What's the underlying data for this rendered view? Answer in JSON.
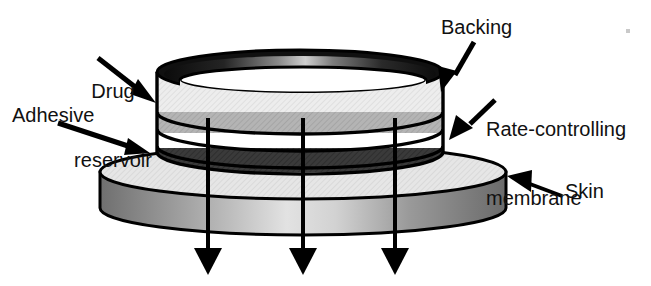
{
  "figure": {
    "type": "labeled-diagram",
    "background_color": "#ffffff"
  },
  "labels": {
    "drug_reservoir": {
      "line1": "Drug",
      "line2": "reservoir"
    },
    "adhesive": "Adhesive",
    "backing": "Backing",
    "rate_membrane": {
      "line1": "Rate-controlling",
      "line2": "membrane"
    },
    "skin": "Skin"
  },
  "layers": [
    {
      "name": "backing",
      "color": "#e8e8e8",
      "order": 1
    },
    {
      "name": "drug-reservoir",
      "color": "#b3b3b3",
      "order": 2
    },
    {
      "name": "rate-controlling-membrane",
      "color": "#ffffff",
      "order": 3
    },
    {
      "name": "adhesive",
      "color": "#3a3a3a",
      "order": 4
    },
    {
      "name": "skin",
      "color": "#8d8d8d",
      "order": 5
    }
  ],
  "flow_arrows": {
    "count": 3,
    "direction": "down",
    "meaning": "drug flux into skin"
  },
  "colors": {
    "outline": "#000000",
    "rim_dark": "#111111",
    "layer_light": "#e9e9e9",
    "layer_gray": "#b0b0b0",
    "layer_white": "#ffffff",
    "layer_dark": "#373737",
    "skin_top": "#e4e4e4",
    "skin_side": "#8f8f8f",
    "text": "#111111"
  }
}
